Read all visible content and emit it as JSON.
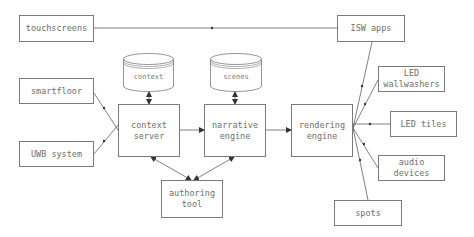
{
  "diagram": {
    "nodes": {
      "touchscreens": {
        "label": "touchscreens",
        "x": 19,
        "y": 15,
        "w": 75,
        "h": 27
      },
      "isw_apps": {
        "label": "ISW apps",
        "x": 337,
        "y": 15,
        "w": 68,
        "h": 27
      },
      "smartfloor": {
        "label": "smartfloor",
        "x": 19,
        "y": 78,
        "w": 75,
        "h": 26
      },
      "uwb_system": {
        "label": "UWB system",
        "x": 19,
        "y": 141,
        "w": 75,
        "h": 26
      },
      "context_server": {
        "label": "context\nserver",
        "x": 118,
        "y": 104,
        "w": 62,
        "h": 53
      },
      "narrative_engine": {
        "label": "narrative\nengine",
        "x": 204,
        "y": 104,
        "w": 62,
        "h": 53
      },
      "rendering_engine": {
        "label": "rendering\nengine",
        "x": 291,
        "y": 104,
        "w": 62,
        "h": 53
      },
      "authoring_tool": {
        "label": "authoring\ntool",
        "x": 161,
        "y": 180,
        "w": 62,
        "h": 38
      },
      "led_wallwashers": {
        "label": "LED\nwallwashers",
        "x": 378,
        "y": 66,
        "w": 67,
        "h": 26
      },
      "led_tiles": {
        "label": "LED tiles",
        "x": 390,
        "y": 111,
        "w": 67,
        "h": 26
      },
      "audio_devices": {
        "label": "audio\ndevices",
        "x": 378,
        "y": 155,
        "w": 67,
        "h": 26
      },
      "spots": {
        "label": "spots",
        "x": 334,
        "y": 200,
        "w": 68,
        "h": 26
      }
    },
    "databases": {
      "context_db": {
        "label": "context",
        "x": 123,
        "y": 53,
        "w": 51,
        "h": 39
      },
      "scenes_db": {
        "label": "scenes",
        "x": 210,
        "y": 53,
        "w": 52,
        "h": 39
      }
    },
    "edges": [
      {
        "from": "touchscreens",
        "to": "isw_apps",
        "type": "directed"
      },
      {
        "from": "smartfloor",
        "to": "context_server",
        "type": "directed"
      },
      {
        "from": "uwb_system",
        "to": "context_server",
        "type": "directed"
      },
      {
        "from": "context_db",
        "to": "context_server",
        "type": "bidirectional"
      },
      {
        "from": "scenes_db",
        "to": "narrative_engine",
        "type": "bidirectional"
      },
      {
        "from": "context_server",
        "to": "narrative_engine",
        "type": "directed"
      },
      {
        "from": "narrative_engine",
        "to": "rendering_engine",
        "type": "directed"
      },
      {
        "from": "context_server",
        "to": "authoring_tool",
        "type": "bidirectional"
      },
      {
        "from": "narrative_engine",
        "to": "authoring_tool",
        "type": "bidirectional"
      },
      {
        "from": "isw_apps",
        "to": "rendering_engine",
        "type": "directed"
      },
      {
        "from": "led_wallwashers",
        "to": "rendering_engine",
        "type": "directed"
      },
      {
        "from": "rendering_engine",
        "to": "led_tiles",
        "type": "directed"
      },
      {
        "from": "rendering_engine",
        "to": "audio_devices",
        "type": "directed"
      },
      {
        "from": "rendering_engine",
        "to": "spots",
        "type": "directed"
      }
    ],
    "colors": {
      "line": "#4a4a4a",
      "border": "#7a7a7a",
      "text": "#6e6e6e"
    }
  }
}
